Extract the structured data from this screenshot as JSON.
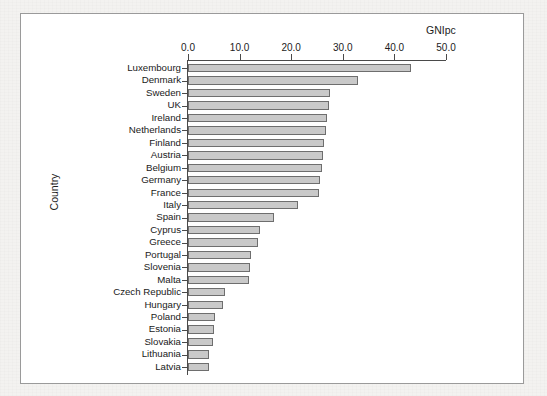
{
  "figure": {
    "background_color": "#ffffff",
    "frame_color": "#9a9a9a",
    "page_background_color": "#f2f2f0"
  },
  "chart_data": {
    "type": "bar",
    "orientation": "horizontal",
    "title": "",
    "xlabel": "GNIpc",
    "ylabel": "Country",
    "xlim": [
      0.0,
      50.0
    ],
    "xticks": [
      "0.0",
      "10.0",
      "20.0",
      "30.0",
      "40.0",
      "50.0"
    ],
    "xtick_values": [
      0.0,
      10.0,
      20.0,
      30.0,
      40.0,
      50.0
    ],
    "grid": false,
    "legend": false,
    "bar_fill_color": "#c9c9c9",
    "bar_edge_color": "#6e6e6e",
    "axis_position": "top",
    "categories": [
      "Luxembourg",
      "Denmark",
      "Sweden",
      "UK",
      "Ireland",
      "Netherlands",
      "Finland",
      "Austria",
      "Belgium",
      "Germany",
      "France",
      "Italy",
      "Spain",
      "Cyprus",
      "Greece",
      "Portugal",
      "Slovenia",
      "Malta",
      "Czech Republic",
      "Hungary",
      "Poland",
      "Estonia",
      "Slovakia",
      "Lithuania",
      "Latvia"
    ],
    "values": [
      43.3,
      32.9,
      27.5,
      27.4,
      26.9,
      26.8,
      26.3,
      26.2,
      25.9,
      25.5,
      25.3,
      21.4,
      16.6,
      14.0,
      13.6,
      12.3,
      12.0,
      11.8,
      7.2,
      6.7,
      5.3,
      5.1,
      4.9,
      4.1,
      4.0
    ]
  }
}
